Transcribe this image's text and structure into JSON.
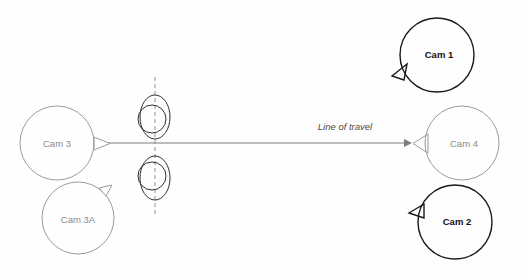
{
  "diagram": {
    "background_color": "#fefefe",
    "width": 522,
    "height": 279,
    "colors": {
      "light_stroke": "#9b9b9b",
      "dark_stroke": "#1a1a1a",
      "light_text": "#8a8a8a",
      "dark_text": "#111111",
      "travel_line": "#7d7d7d",
      "axis_dashed": "#8e8e8e",
      "target_stroke": "#2f2f2f"
    }
  },
  "travel": {
    "label": "Line of travel",
    "label_x": 345,
    "label_y": 127,
    "line_y": 143,
    "line_x_start": 100,
    "line_x_end": 404,
    "arrow_tip_x": 410
  },
  "axis": {
    "x": 155,
    "y_top": 77,
    "y_bottom": 217
  },
  "targets": [
    {
      "name": "target-upper",
      "cx": 155,
      "cy": 117,
      "ellipse_rx": 15,
      "ellipse_ry": 22,
      "circle_cx": 152,
      "circle_cy": 119,
      "circle_r": 14
    },
    {
      "name": "target-lower",
      "cx": 155,
      "cy": 178,
      "ellipse_rx": 15,
      "ellipse_ry": 22,
      "circle_cx": 152,
      "circle_cy": 176,
      "circle_r": 14
    }
  ],
  "cameras": [
    {
      "id": "cam-3",
      "label": "Cam 3",
      "cx": 57,
      "cy": 143,
      "r": 37,
      "style": "light",
      "label_x": 57,
      "label_y": 144,
      "pointer": "M 94 137 L 110 143.5 L 94 150 Z"
    },
    {
      "id": "cam-3a",
      "label": "Cam 3A",
      "cx": 78,
      "cy": 218,
      "r": 36,
      "style": "light",
      "label_x": 78,
      "label_y": 220,
      "pointer": "M 99 188 L 112 185 L 106 196 Z"
    },
    {
      "id": "cam-1",
      "label": "Cam 1",
      "cx": 437,
      "cy": 55,
      "r": 37,
      "style": "dark",
      "label_x": 439,
      "label_y": 55,
      "pointer": "M 407 64 L 392 76 L 404 80 Z"
    },
    {
      "id": "cam-4",
      "label": "Cam 4",
      "cx": 462,
      "cy": 143,
      "r": 37,
      "style": "light",
      "label_x": 464,
      "label_y": 144,
      "pointer": "M 428 134 L 413 143.5 L 428 153 Z"
    },
    {
      "id": "cam-2",
      "label": "Cam 2",
      "cx": 455,
      "cy": 222,
      "r": 37,
      "style": "dark",
      "label_x": 457,
      "label_y": 222,
      "pointer": "M 424 204 L 409 213 L 424 218 Z"
    }
  ]
}
